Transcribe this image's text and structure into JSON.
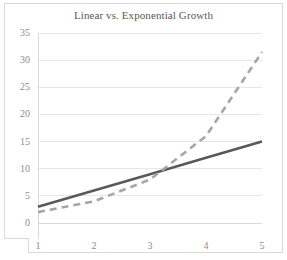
{
  "chart_data": {
    "type": "line",
    "title": "Linear vs. Exponential Growth",
    "xlabel": "",
    "ylabel": "",
    "x": [
      1,
      2,
      3,
      4,
      5
    ],
    "categories": [
      "1",
      "2",
      "3",
      "4",
      "5"
    ],
    "xtick_labels": [
      "1",
      "2",
      "3",
      "4",
      "5"
    ],
    "ytick_labels": [
      "0",
      "5",
      "10",
      "15",
      "20",
      "25",
      "30",
      "35"
    ],
    "yticks": [
      0,
      5,
      10,
      15,
      20,
      25,
      30,
      35
    ],
    "ylim": [
      0,
      35
    ],
    "xlim": [
      1,
      5
    ],
    "grid": "horizontal",
    "legend": "none",
    "series": [
      {
        "name": "Linear",
        "values": [
          3,
          6,
          9,
          12,
          15
        ],
        "color": "#595959",
        "style": "solid",
        "width": 2.6
      },
      {
        "name": "Exponential",
        "values": [
          2,
          4,
          8,
          16,
          31.5
        ],
        "color": "#a6a6a6",
        "style": "dashed",
        "width": 2.6
      }
    ]
  },
  "style": {
    "background": "#ffffff",
    "gridline_color": "#e6e6e6",
    "axis_color": "#d9d9d9",
    "title_color": "#595959",
    "tick_color": "#8c8c8c",
    "frame_color": "#d9d9d9"
  },
  "icons": {
    "chart_area": "line-chart-plot"
  }
}
